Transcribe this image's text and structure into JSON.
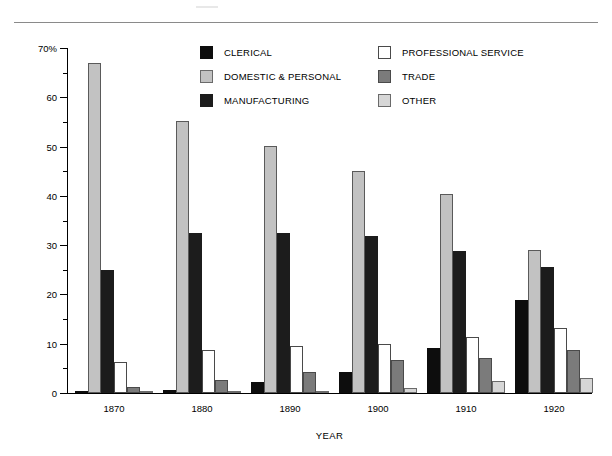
{
  "chart_data": {
    "type": "bar",
    "title": "",
    "xlabel": "YEAR",
    "ylabel": "OCCUPATIONAL DISTRIBUTION (percentage)",
    "categories": [
      "1870",
      "1880",
      "1890",
      "1900",
      "1910",
      "1920"
    ],
    "ylim": [
      0,
      70
    ],
    "ytick_labels": [
      "0",
      "10",
      "20",
      "30",
      "40",
      "50",
      "60",
      "70%"
    ],
    "ytick_values": [
      0,
      10,
      20,
      30,
      40,
      50,
      60,
      70
    ],
    "yminor_step": 5,
    "grid": false,
    "legend_position": "top-center",
    "series": [
      {
        "name": "CLERICAL",
        "color": "#0d0d0d",
        "values": [
          0.5,
          0.6,
          2.3,
          4.2,
          9.2,
          18.9
        ]
      },
      {
        "name": "DOMESTIC & PERSONAL",
        "color": "#c2c2c2",
        "values": [
          67.0,
          55.2,
          50.1,
          45.0,
          40.3,
          29.0
        ]
      },
      {
        "name": "MANUFACTURING",
        "color": "#1c1c1c",
        "values": [
          25.0,
          32.4,
          32.5,
          31.8,
          28.8,
          25.6
        ]
      },
      {
        "name": "PROFESSIONAL SERVICE",
        "color": "#ffffff",
        "values": [
          6.3,
          8.7,
          9.5,
          10.0,
          11.4,
          13.1
        ]
      },
      {
        "name": "TRADE",
        "color": "#7b7b7b",
        "values": [
          1.2,
          2.7,
          4.3,
          6.7,
          7.1,
          8.7
        ]
      },
      {
        "name": "OTHER",
        "color": "#d6d6d6",
        "values": [
          0.3,
          0.3,
          0.4,
          1.0,
          2.4,
          3.0
        ]
      }
    ]
  },
  "legend": {
    "columns": [
      [
        "CLERICAL",
        "DOMESTIC & PERSONAL",
        "MANUFACTURING"
      ],
      [
        "PROFESSIONAL SERVICE",
        "TRADE",
        "OTHER"
      ]
    ]
  },
  "axes": {
    "y_title": "OCCUPATIONAL DISTRIBUTION (percentage)",
    "x_title": "YEAR"
  }
}
